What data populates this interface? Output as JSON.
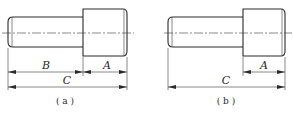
{
  "figures": [
    {
      "id": "a",
      "caption": "( a )",
      "dimensions": [
        {
          "label": "B",
          "from": "shaft-left-end",
          "to": "shoulder"
        },
        {
          "label": "A",
          "from": "shoulder",
          "to": "head-right-end"
        },
        {
          "label": "C",
          "from": "shaft-left-end",
          "to": "head-right-end"
        }
      ],
      "labels": {
        "B": "B",
        "A": "A",
        "C": "C"
      }
    },
    {
      "id": "b",
      "caption": "( b )",
      "dimensions": [
        {
          "label": "A",
          "from": "shoulder",
          "to": "head-right-end"
        },
        {
          "label": "C",
          "from": "shaft-left-end",
          "to": "head-right-end"
        }
      ],
      "labels": {
        "A": "A",
        "C": "C"
      }
    }
  ],
  "colors": {
    "line": "#2a2a2a",
    "background": "#ffffff"
  }
}
